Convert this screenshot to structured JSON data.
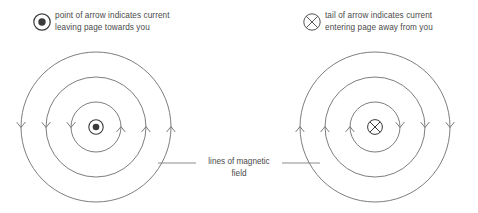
{
  "diagram": {
    "background_color": "#ffffff",
    "stroke_color": "#6e6e6e",
    "text_color": "#4a4a4a",
    "legend": {
      "left": {
        "icon": "current-out-of-page-icon",
        "line1": "point of arrow indicates current",
        "line2": "leaving page towards you"
      },
      "right": {
        "icon": "current-into-page-icon",
        "line1": "tail of arrow indicates current",
        "line2": "entering page away from you"
      }
    },
    "field_label": "lines of magnetic\nfield",
    "panels": [
      {
        "name": "current-out-of-page-panel",
        "center_symbol": "dot-in-circle",
        "current_direction": "out of page",
        "circulation": "counterclockwise",
        "center": {
          "x": 96,
          "y": 127
        },
        "radii": [
          25,
          50,
          75
        ],
        "arrow_direction_left": "down",
        "arrow_direction_right": "up",
        "arrow_count": 6
      },
      {
        "name": "current-into-page-panel",
        "center_symbol": "cross-in-circle",
        "current_direction": "into page",
        "circulation": "clockwise",
        "center": {
          "x": 375,
          "y": 127
        },
        "radii": [
          25,
          50,
          75
        ],
        "arrow_direction_left": "up",
        "arrow_direction_right": "down",
        "arrow_count": 6
      }
    ],
    "leader_lines": [
      {
        "name": "leader-line-left",
        "x1": 158,
        "x2": 196,
        "y": 163
      },
      {
        "name": "leader-line-right",
        "x1": 282,
        "x2": 320,
        "y": 163
      }
    ]
  }
}
